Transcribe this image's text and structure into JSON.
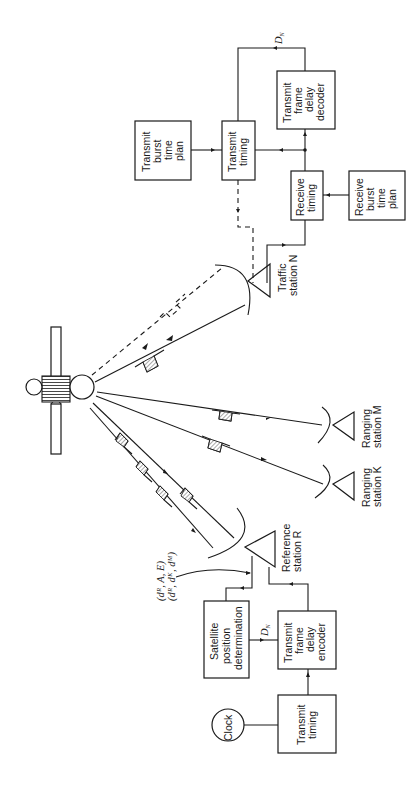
{
  "diagram": {
    "orientation": "rotated-90-ccw",
    "blocks": {
      "transmit_burst_time_plan": [
        "Transmit",
        "burst",
        "time",
        "plan"
      ],
      "transmit_timing_n": [
        "Transmit",
        "timing"
      ],
      "transmit_frame_delay_decoder": [
        "Transmit",
        "frame",
        "delay",
        "decoder"
      ],
      "receive_timing": [
        "Receive",
        "timing"
      ],
      "receive_burst_time_plan": [
        "Receive",
        "burst",
        "time",
        "plan"
      ],
      "satellite_position_determination": [
        "Satellite",
        "position",
        "determination"
      ],
      "transmit_frame_delay_encoder": [
        "Transmit",
        "frame",
        "delay",
        "encoder"
      ],
      "transmit_timing_r": [
        "Transmit",
        "timing"
      ],
      "clock": "Clock"
    },
    "stations": {
      "traffic_n": [
        "Traffic",
        "station N"
      ],
      "ranging_m": [
        "Ranging",
        "station M"
      ],
      "ranging_k": [
        "Ranging",
        "station K"
      ],
      "reference_r": [
        "Reference",
        "station R"
      ]
    },
    "signals": {
      "dn_top": "D",
      "dn_top_sub": "N",
      "dn_bottom": "D",
      "dn_bottom_sub": "N",
      "params_line1": "(dᴿ, A, E)",
      "params_line2": "(dᴿ, dᴷ, dᴹ)"
    }
  }
}
